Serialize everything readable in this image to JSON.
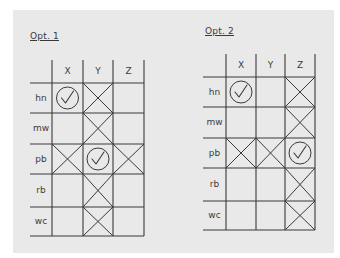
{
  "options": [
    {
      "title": "Opt. 1",
      "columns": [
        "X",
        "Y",
        "Z"
      ],
      "rows": [
        {
          "label": "hn",
          "cells": [
            "check",
            "cross",
            "empty"
          ]
        },
        {
          "label": "mw",
          "cells": [
            "empty",
            "cross",
            "empty"
          ]
        },
        {
          "label": "pb",
          "cells": [
            "cross",
            "check",
            "cross"
          ]
        },
        {
          "label": "rb",
          "cells": [
            "empty",
            "cross",
            "empty"
          ]
        },
        {
          "label": "wc",
          "cells": [
            "empty",
            "cross",
            "empty"
          ]
        }
      ]
    },
    {
      "title": "Opt. 2",
      "columns": [
        "X",
        "Y",
        "Z"
      ],
      "rows": [
        {
          "label": "hn",
          "cells": [
            "check",
            "empty",
            "cross"
          ]
        },
        {
          "label": "mw",
          "cells": [
            "empty",
            "empty",
            "cross"
          ]
        },
        {
          "label": "pb",
          "cells": [
            "cross",
            "cross",
            "check"
          ]
        },
        {
          "label": "rb",
          "cells": [
            "empty",
            "empty",
            "cross"
          ]
        },
        {
          "label": "wc",
          "cells": [
            "empty",
            "empty",
            "cross"
          ]
        }
      ]
    }
  ],
  "colors": {
    "panel": "#e9e9e9",
    "ink": "#3a3a3a"
  }
}
